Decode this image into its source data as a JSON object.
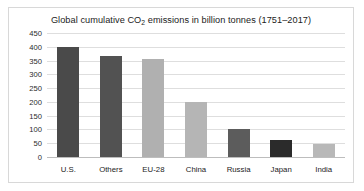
{
  "chart_data": {
    "type": "bar",
    "title": "Global cumulative CO2 emissions in billion tonnes (1751–2017)",
    "title_parts": {
      "before": "Global cumulative CO",
      "subscript": "2",
      "after": " emissions in billion tonnes (1751–2017)"
    },
    "xlabel": "",
    "ylabel": "",
    "ylim": [
      0,
      450
    ],
    "ytick_step": 50,
    "yticks": [
      "450",
      "400",
      "350",
      "300",
      "250",
      "200",
      "150",
      "100",
      "50",
      "0"
    ],
    "grid": true,
    "legend": "none",
    "categories": [
      "U.S.",
      "Others",
      "EU-28",
      "China",
      "Russia",
      "Japan",
      "India"
    ],
    "values": [
      398,
      365,
      355,
      198,
      100,
      60,
      48
    ],
    "bar_colors": [
      "#4a4a4a",
      "#525252",
      "#b0b0b0",
      "#b5b5b5",
      "#5c5c5c",
      "#2b2b2b",
      "#b8b8b8"
    ]
  },
  "colors": {
    "frame_border": "#d8d8d8",
    "gridline": "#dedede",
    "baseline": "#bdbdbd",
    "text": "#1b1b1b",
    "background": "#ffffff"
  }
}
